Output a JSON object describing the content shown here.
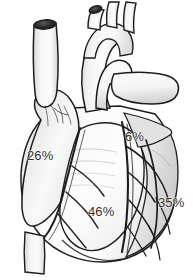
{
  "figure": {
    "kind": "anatomical-illustration",
    "background_color": "#ffffff",
    "line_color": "#1e1d1c",
    "fill_color": "#fbfbfb",
    "shade_color": "#c9c9c9",
    "label_color": "#33312f",
    "width": 193,
    "height": 280
  },
  "labels": {
    "right_region": "26%",
    "upper_right_region": "6%",
    "lower_center_region": "46%",
    "right_lateral_region": "35%"
  },
  "structures": {
    "aorta": "aorta",
    "superior_vena_cava": "superior-vena-cava",
    "pulmonary_trunk": "pulmonary-trunk",
    "right_pulmonary_artery": "right-pulmonary-artery",
    "brachiocephalic_branches": "brachiocephalic-branches",
    "right_atrial_appendage": "right-atrial-appendage",
    "right_ventricle": "right-ventricle",
    "left_ventricle": "left-ventricle",
    "coronary_arteries": "coronary-arteries",
    "inferior_vena_cava": "inferior-vena-cava"
  }
}
